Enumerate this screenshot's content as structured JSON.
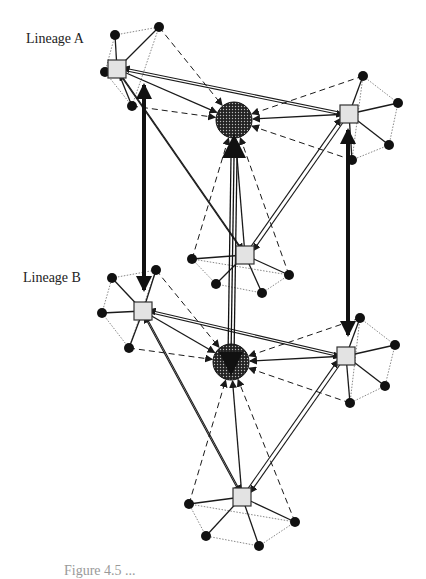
{
  "labels": {
    "lineage_a": "Lineage A",
    "lineage_b": "Lineage B",
    "caption_partial": "Figure 4.5 ..."
  },
  "colors": {
    "stroke": "#1a1a1a",
    "square_fill": "#e3e3e3",
    "hub_fill": "#333333",
    "satellite_fill": "#111111",
    "dotted_ring": "#888888"
  },
  "lineages": [
    {
      "name": "Lineage A",
      "hub": {
        "x": 234,
        "y": 120,
        "r": 18
      },
      "members": [
        {
          "id": "A1",
          "x": 117,
          "y": 69,
          "satellites": [
            [
              115,
              35
            ],
            [
              159,
              27
            ],
            [
              105,
              72
            ],
            [
              132,
              106
            ]
          ]
        },
        {
          "id": "A2",
          "x": 349,
          "y": 114,
          "satellites": [
            [
              363,
              76
            ],
            [
              398,
              103
            ],
            [
              389,
              145
            ],
            [
              352,
              160
            ]
          ]
        },
        {
          "id": "A3",
          "x": 245,
          "y": 255,
          "satellites": [
            [
              192,
              259
            ],
            [
              216,
              284
            ],
            [
              262,
              293
            ],
            [
              289,
              275
            ]
          ]
        }
      ]
    },
    {
      "name": "Lineage B",
      "hub": {
        "x": 231,
        "y": 362,
        "r": 18
      },
      "members": [
        {
          "id": "B1",
          "x": 143,
          "y": 311,
          "satellites": [
            [
              112,
              278
            ],
            [
              156,
              270
            ],
            [
              102,
              313
            ],
            [
              129,
              348
            ]
          ]
        },
        {
          "id": "B2",
          "x": 346,
          "y": 356,
          "satellites": [
            [
              360,
              318
            ],
            [
              395,
              345
            ],
            [
              385,
              386
            ],
            [
              350,
              403
            ]
          ]
        },
        {
          "id": "B3",
          "x": 242,
          "y": 497,
          "satellites": [
            [
              189,
              504
            ],
            [
              206,
              536
            ],
            [
              259,
              546
            ],
            [
              295,
              522
            ]
          ]
        }
      ]
    }
  ],
  "cross_links": [
    {
      "from": "A1",
      "to": "B1",
      "style": "thick-double-arrow"
    },
    {
      "from": "A2",
      "to": "B2",
      "style": "thick-double-arrow"
    },
    {
      "from": "hubA",
      "to": "hubB",
      "style": "triple-line-double-arrow"
    }
  ]
}
